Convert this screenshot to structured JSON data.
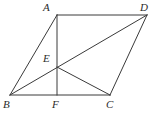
{
  "figure": {
    "background_color": "#ffffff",
    "line_color": "#3a3a3a",
    "label_color": "#2b2b2b",
    "viewbox": {
      "width": 157,
      "height": 127
    },
    "points": {
      "A": {
        "label": "A",
        "x": 57,
        "y": 15
      },
      "B": {
        "label": "B",
        "x": 10,
        "y": 95
      },
      "C": {
        "label": "C",
        "x": 110,
        "y": 95
      },
      "D": {
        "label": "D",
        "x": 147,
        "y": 15
      },
      "E": {
        "label": "E",
        "x": 57,
        "y": 67
      },
      "F": {
        "label": "F",
        "x": 57,
        "y": 95
      }
    },
    "segments": [
      {
        "name": "AD",
        "from": "A",
        "to": "D"
      },
      {
        "name": "DC",
        "from": "D",
        "to": "C"
      },
      {
        "name": "CB",
        "from": "C",
        "to": "B"
      },
      {
        "name": "BA",
        "from": "B",
        "to": "A"
      },
      {
        "name": "BD",
        "from": "B",
        "to": "D"
      },
      {
        "name": "AF",
        "from": "A",
        "to": "F"
      },
      {
        "name": "EC",
        "from": "E",
        "to": "C"
      }
    ]
  }
}
